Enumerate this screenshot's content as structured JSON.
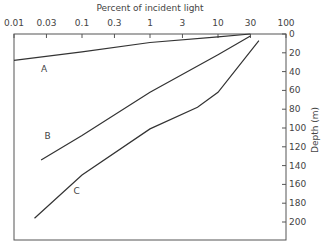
{
  "chart_data": {
    "type": "line",
    "title": "",
    "xlabel": "Percent of incident light",
    "ylabel": "Depth (m)",
    "x_scale": "log",
    "x_axis_position": "top",
    "y_axis_position": "right",
    "y_inverted": true,
    "xlim": [
      0.01,
      100
    ],
    "ylim": [
      0,
      220
    ],
    "x_ticks": [
      "0.01",
      "0.03",
      "0.1",
      "0.3",
      "1",
      "3",
      "10",
      "30",
      "100"
    ],
    "y_ticks": [
      "0",
      "20",
      "40",
      "60",
      "80",
      "100",
      "120",
      "140",
      "160",
      "180",
      "200"
    ],
    "grid": false,
    "legend": "inline labels",
    "series": [
      {
        "name": "A",
        "points": [
          [
            0.01,
            28
          ],
          [
            0.1,
            19
          ],
          [
            1,
            9
          ],
          [
            10,
            3
          ],
          [
            30,
            0
          ]
        ]
      },
      {
        "name": "B",
        "points": [
          [
            0.025,
            134
          ],
          [
            0.1,
            108
          ],
          [
            1,
            62
          ],
          [
            10,
            22
          ],
          [
            30,
            2
          ]
        ]
      },
      {
        "name": "C",
        "points": [
          [
            0.02,
            196
          ],
          [
            0.1,
            150
          ],
          [
            1,
            101
          ],
          [
            5,
            78
          ],
          [
            10,
            62
          ],
          [
            40,
            7
          ]
        ]
      }
    ]
  }
}
